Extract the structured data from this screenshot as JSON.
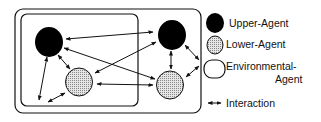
{
  "diagram": {
    "type": "multi-agent interaction diagram",
    "nodes": [
      {
        "id": "upper-left",
        "kind": "Upper-Agent"
      },
      {
        "id": "lower-left",
        "kind": "Lower-Agent"
      },
      {
        "id": "upper-right",
        "kind": "Upper-Agent"
      },
      {
        "id": "lower-right",
        "kind": "Lower-Agent"
      }
    ],
    "containers": [
      {
        "id": "outer-environment",
        "kind": "Environmental-Agent"
      },
      {
        "id": "inner-environment",
        "kind": "Environmental-Agent"
      }
    ]
  },
  "legend": {
    "upper": "Upper-Agent",
    "lower": "Lower-Agent",
    "env_line1": "Environmental-",
    "env_line2": "Agent",
    "interaction": "Interaction"
  },
  "colors": {
    "upper_fill": "#000000",
    "lower_fill": "#d8d8d8",
    "stroke": "#111111"
  }
}
